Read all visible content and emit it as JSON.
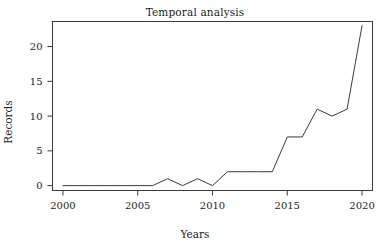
{
  "chart_data": {
    "type": "line",
    "title": "Temporal analysis",
    "xlabel": "Years",
    "ylabel": "Records",
    "x": [
      2000,
      2001,
      2002,
      2003,
      2004,
      2005,
      2006,
      2007,
      2008,
      2009,
      2010,
      2011,
      2012,
      2013,
      2014,
      2015,
      2016,
      2017,
      2018,
      2019,
      2020
    ],
    "values": [
      0,
      0,
      0,
      0,
      0,
      0,
      0,
      1,
      0,
      1,
      0,
      2,
      2,
      2,
      2,
      7,
      7,
      11,
      10,
      11,
      23
    ],
    "series": [
      {
        "name": "Records",
        "values": [
          0,
          0,
          0,
          0,
          0,
          0,
          0,
          1,
          0,
          1,
          0,
          2,
          2,
          2,
          2,
          7,
          7,
          11,
          10,
          11,
          23
        ]
      }
    ],
    "xticks": [
      2000,
      2005,
      2010,
      2015,
      2020
    ],
    "xtick_labels": [
      "2000",
      "2005",
      "2010",
      "2015",
      "2020"
    ],
    "yticks": [
      0,
      5,
      10,
      15,
      20
    ],
    "ytick_labels": [
      "0",
      "5",
      "10",
      "15",
      "20"
    ],
    "xlim": [
      1999.3,
      2020.7
    ],
    "ylim": [
      -0.7,
      23.6
    ],
    "grid": false,
    "legend": false,
    "line_color": "#3a3a3a",
    "frame_color": "#3a3a3a",
    "background_color": "#ffffff"
  }
}
